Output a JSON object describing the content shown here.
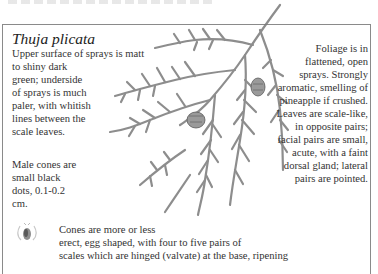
{
  "page": {
    "species_name": "Thuja plicata",
    "upper_surface": {
      "line1": "Upper surface of sprays is  matt",
      "rest": "to shiny dark green; underside of sprays is much paler, with whitish lines between the scale leaves."
    },
    "male_cones": "Male cones are small black dots, 0.1-0.2 cm.",
    "foliage": "Foliage is in flattened, open sprays. Strongly aromatic, smelling of pineapple if crushed. Leaves are scale-like, in opposite pairs; facial pairs are small, acute, with a faint dorsal gland; lateral pairs are pointed.",
    "cones": {
      "line1": "Cones are more or less",
      "line2": "erect, egg shaped, with four to five pairs of",
      "line3": "scales which are hinged (valvate) at the base, ripening"
    },
    "illustration": {
      "subject": "western red cedar foliage spray with cones",
      "stroke_color": "#6f6f6f"
    },
    "icons": {
      "cone": "cone-icon"
    }
  }
}
